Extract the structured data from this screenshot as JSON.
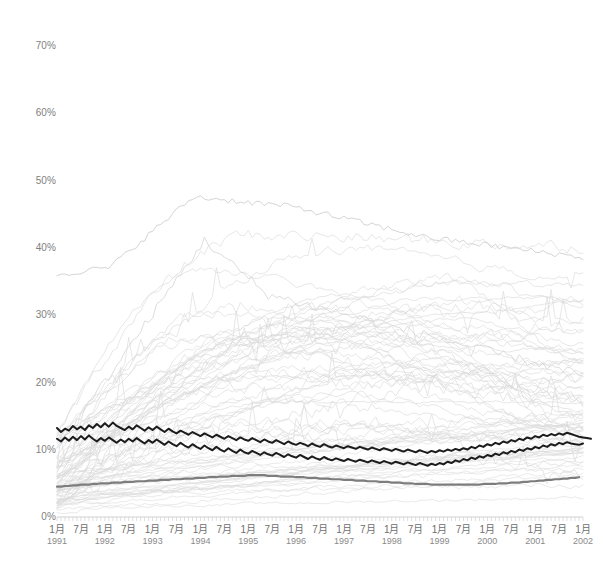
{
  "chart_data": {
    "type": "line",
    "title": "",
    "subtitle": "",
    "xlabel": "",
    "ylabel": "",
    "ylim": [
      0,
      70
    ],
    "yunit": "%",
    "ytick_labels": [
      "0%",
      "10%",
      "20%",
      "30%",
      "40%",
      "50%",
      "60%",
      "70%"
    ],
    "ytick_values": [
      0,
      10,
      20,
      30,
      40,
      50,
      60,
      70
    ],
    "grid": false,
    "legend": "none",
    "x_start": "1991-01",
    "x_end": "2002-01",
    "x_interval": "monthly",
    "xtick_labels": [
      {
        "month": "1月",
        "year": "1991"
      },
      {
        "month": "7月",
        "year": ""
      },
      {
        "month": "1月",
        "year": "1992"
      },
      {
        "month": "7月",
        "year": ""
      },
      {
        "month": "1月",
        "year": "1993"
      },
      {
        "month": "7月",
        "year": ""
      },
      {
        "month": "1月",
        "year": "1994"
      },
      {
        "month": "7月",
        "year": ""
      },
      {
        "month": "1月",
        "year": "1995"
      },
      {
        "month": "7月",
        "year": ""
      },
      {
        "month": "1月",
        "year": "1996"
      },
      {
        "month": "7月",
        "year": ""
      },
      {
        "month": "1月",
        "year": "1997"
      },
      {
        "month": "7月",
        "year": ""
      },
      {
        "month": "1月",
        "year": "1998"
      },
      {
        "month": "7月",
        "year": ""
      },
      {
        "month": "1月",
        "year": "1999"
      },
      {
        "month": "7月",
        "year": ""
      },
      {
        "month": "1月",
        "year": "2000"
      },
      {
        "month": "7月",
        "year": ""
      },
      {
        "month": "1月",
        "year": "2001"
      },
      {
        "month": "7月",
        "year": ""
      },
      {
        "month": "1月",
        "year": "2002"
      }
    ],
    "colors": {
      "background_series": "#d9d9d9",
      "highlight_dark": "#1c1c1c",
      "highlight_gray": "#7d7d7d",
      "axis": "#cfcfcf",
      "tick_text": "#7a7a7a"
    },
    "series": [
      {
        "name": "highlight-dark-upper",
        "emphasis": "dark",
        "color": "#1c1c1c",
        "values": [
          13.2,
          12.6,
          13.1,
          12.8,
          13.5,
          13.0,
          13.4,
          12.9,
          13.6,
          13.2,
          13.8,
          13.3,
          13.9,
          13.4,
          14.0,
          13.5,
          13.2,
          12.9,
          13.4,
          13.0,
          13.6,
          13.2,
          12.8,
          13.3,
          12.9,
          13.4,
          13.0,
          12.6,
          13.1,
          12.7,
          12.4,
          12.8,
          12.5,
          12.2,
          12.6,
          12.3,
          12.0,
          12.4,
          12.1,
          11.8,
          12.2,
          11.9,
          11.6,
          12.0,
          11.7,
          11.4,
          11.8,
          11.5,
          11.3,
          11.7,
          11.4,
          11.1,
          11.5,
          11.2,
          11.0,
          11.4,
          11.1,
          10.8,
          11.2,
          10.9,
          10.7,
          11.0,
          10.8,
          10.5,
          10.9,
          10.6,
          10.4,
          10.8,
          10.5,
          10.3,
          10.6,
          10.4,
          10.2,
          10.5,
          10.3,
          10.1,
          10.4,
          10.2,
          10.0,
          10.3,
          10.1,
          9.9,
          10.2,
          10.0,
          9.8,
          10.1,
          9.9,
          9.7,
          10.0,
          9.8,
          9.6,
          9.9,
          9.7,
          9.5,
          9.8,
          9.6,
          9.9,
          9.7,
          10.0,
          9.8,
          10.1,
          9.9,
          10.2,
          10.0,
          10.4,
          10.2,
          10.6,
          10.4,
          10.8,
          10.6,
          11.0,
          10.8,
          11.2,
          11.0,
          11.4,
          11.2,
          11.6,
          11.4,
          11.8,
          11.6,
          12.0,
          11.8,
          12.2,
          12.0,
          12.3,
          12.1,
          12.4,
          12.2,
          12.5,
          12.3,
          12.1,
          11.9,
          11.8,
          11.7,
          11.6
        ]
      },
      {
        "name": "highlight-dark-lower",
        "emphasis": "dark",
        "color": "#1c1c1c",
        "values": [
          11.6,
          11.2,
          11.8,
          11.3,
          11.9,
          11.4,
          12.0,
          11.5,
          12.1,
          11.6,
          11.2,
          11.7,
          11.3,
          11.8,
          11.4,
          11.0,
          11.5,
          11.1,
          11.6,
          11.2,
          11.7,
          11.3,
          10.9,
          11.4,
          11.0,
          11.5,
          11.1,
          10.7,
          11.2,
          10.8,
          10.5,
          11.0,
          10.6,
          10.3,
          10.8,
          10.4,
          10.1,
          10.6,
          10.2,
          9.9,
          10.4,
          10.0,
          9.7,
          10.2,
          9.8,
          9.5,
          10.0,
          9.6,
          9.4,
          9.8,
          9.5,
          9.2,
          9.6,
          9.3,
          9.1,
          9.5,
          9.2,
          8.9,
          9.3,
          9.0,
          8.8,
          9.2,
          8.9,
          8.6,
          9.0,
          8.7,
          8.5,
          8.9,
          8.6,
          8.4,
          8.7,
          8.5,
          8.3,
          8.6,
          8.4,
          8.2,
          8.5,
          8.3,
          8.1,
          8.4,
          8.2,
          8.0,
          8.3,
          8.1,
          7.9,
          8.2,
          8.0,
          7.8,
          8.1,
          7.9,
          7.7,
          8.0,
          7.8,
          7.6,
          7.9,
          7.7,
          8.0,
          7.8,
          8.2,
          8.0,
          8.4,
          8.2,
          8.6,
          8.4,
          8.8,
          8.6,
          9.0,
          8.8,
          9.2,
          9.0,
          9.4,
          9.2,
          9.6,
          9.4,
          9.8,
          9.6,
          10.0,
          9.8,
          10.2,
          10.0,
          10.4,
          10.2,
          10.6,
          10.4,
          10.8,
          10.6,
          11.0,
          10.8,
          11.1,
          10.9,
          10.8,
          10.7,
          10.9
        ]
      },
      {
        "name": "highlight-gray-lower",
        "emphasis": "gray",
        "color": "#7d7d7d",
        "values": [
          4.5,
          4.5,
          4.6,
          4.6,
          4.7,
          4.7,
          4.8,
          4.8,
          4.8,
          4.9,
          4.9,
          5.0,
          5.0,
          5.0,
          5.1,
          5.1,
          5.1,
          5.2,
          5.2,
          5.2,
          5.3,
          5.3,
          5.3,
          5.4,
          5.4,
          5.4,
          5.5,
          5.5,
          5.5,
          5.6,
          5.6,
          5.6,
          5.7,
          5.7,
          5.7,
          5.8,
          5.8,
          5.8,
          5.9,
          5.9,
          5.9,
          6.0,
          6.0,
          6.0,
          6.1,
          6.1,
          6.1,
          6.1,
          6.2,
          6.2,
          6.2,
          6.2,
          6.2,
          6.1,
          6.1,
          6.1,
          6.0,
          6.0,
          6.0,
          6.0,
          5.9,
          5.9,
          5.9,
          5.8,
          5.8,
          5.8,
          5.7,
          5.7,
          5.7,
          5.6,
          5.6,
          5.6,
          5.5,
          5.5,
          5.5,
          5.4,
          5.4,
          5.4,
          5.3,
          5.3,
          5.3,
          5.2,
          5.2,
          5.2,
          5.1,
          5.1,
          5.1,
          5.0,
          5.0,
          5.0,
          4.9,
          4.9,
          4.9,
          4.9,
          4.8,
          4.8,
          4.8,
          4.8,
          4.8,
          4.8,
          4.8,
          4.8,
          4.8,
          4.8,
          4.8,
          4.8,
          4.8,
          4.9,
          4.9,
          4.9,
          4.9,
          5.0,
          5.0,
          5.0,
          5.1,
          5.1,
          5.1,
          5.2,
          5.2,
          5.3,
          5.3,
          5.4,
          5.4,
          5.5,
          5.5,
          5.6,
          5.6,
          5.7,
          5.7,
          5.8,
          5.8,
          5.9
        ]
      }
    ],
    "background_series_count": 48,
    "background_series_note": "Light gray background lines, many rising from under 10% in 1991 to 20-43% by 2002; one peaks near 48% in early 1994."
  }
}
